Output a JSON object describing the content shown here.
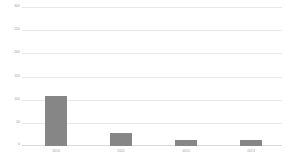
{
  "chart_data": {
    "type": "bar",
    "title": "",
    "subtitle": "",
    "xlabel": "",
    "ylabel": "",
    "categories": [
      "2010",
      "2011",
      "2012",
      "2013"
    ],
    "values": [
      270,
      108,
      28,
      13
    ],
    "series": [
      {
        "name": "",
        "values": [
          270,
          108,
          28,
          13
        ]
      }
    ],
    "ylim": [
      0,
      300
    ],
    "yticks": [
      0,
      50,
      100,
      150,
      200,
      250,
      300
    ],
    "ytick_labels": [
      "0",
      "50",
      "100",
      "150",
      "200",
      "250",
      "300"
    ],
    "grid": true,
    "grid_axis": "y",
    "legend": false,
    "legend_position": "none",
    "bar_color": "#868686",
    "grid_color": "#e8e8e8",
    "axis_text_color": "#9a9a9a",
    "background_color": "#ffffff"
  }
}
